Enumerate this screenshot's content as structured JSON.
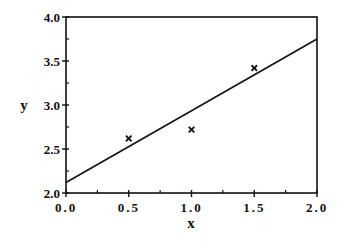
{
  "chart_data": {
    "type": "scatter",
    "title": "",
    "xlabel": "x",
    "ylabel": "y",
    "xlim": [
      0.0,
      2.0
    ],
    "ylim": [
      2.0,
      4.0
    ],
    "grid": false,
    "legend": null,
    "x_ticks": [
      "0.0",
      "0.5",
      "1.0",
      "1.5",
      "2.0"
    ],
    "y_ticks": [
      "2.0",
      "2.5",
      "3.0",
      "3.5",
      "4.0"
    ],
    "series": [
      {
        "name": "data points",
        "marker": "x",
        "x": [
          0.5,
          1.0,
          1.5
        ],
        "y": [
          2.62,
          2.72,
          3.42
        ]
      },
      {
        "name": "fitted line",
        "type": "line",
        "x": [
          0.0,
          2.0
        ],
        "y": [
          2.12,
          3.75
        ]
      }
    ]
  },
  "colors": {
    "axis": "#111111",
    "line": "#111111",
    "marker": "#111111"
  }
}
